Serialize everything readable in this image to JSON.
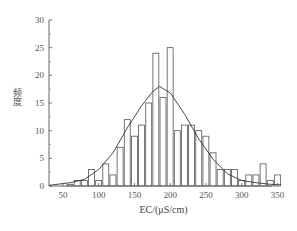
{
  "chart_data": {
    "type": "bar",
    "subtype": "histogram_with_normal_fit",
    "title": "",
    "xlabel": "EC/(μS/cm)",
    "ylabel": "频度",
    "xlim": [
      30,
      355
    ],
    "ylim": [
      0,
      30
    ],
    "xticks": [
      50,
      100,
      150,
      200,
      250,
      300,
      350
    ],
    "yticks": [
      0,
      5,
      10,
      15,
      20,
      25,
      30
    ],
    "grid": false,
    "legend": null,
    "bin_width": 10,
    "bins": [
      {
        "x": 60,
        "count": 0.3
      },
      {
        "x": 70,
        "count": 1
      },
      {
        "x": 80,
        "count": 1
      },
      {
        "x": 90,
        "count": 3
      },
      {
        "x": 100,
        "count": 1
      },
      {
        "x": 110,
        "count": 4
      },
      {
        "x": 120,
        "count": 2
      },
      {
        "x": 130,
        "count": 7
      },
      {
        "x": 140,
        "count": 12
      },
      {
        "x": 150,
        "count": 9
      },
      {
        "x": 160,
        "count": 11
      },
      {
        "x": 170,
        "count": 15
      },
      {
        "x": 180,
        "count": 24
      },
      {
        "x": 190,
        "count": 16
      },
      {
        "x": 200,
        "count": 25
      },
      {
        "x": 210,
        "count": 10
      },
      {
        "x": 220,
        "count": 11
      },
      {
        "x": 230,
        "count": 11
      },
      {
        "x": 240,
        "count": 10
      },
      {
        "x": 250,
        "count": 9
      },
      {
        "x": 260,
        "count": 6
      },
      {
        "x": 270,
        "count": 3
      },
      {
        "x": 280,
        "count": 3
      },
      {
        "x": 290,
        "count": 3
      },
      {
        "x": 300,
        "count": 1
      },
      {
        "x": 310,
        "count": 2
      },
      {
        "x": 320,
        "count": 2
      },
      {
        "x": 330,
        "count": 4
      },
      {
        "x": 340,
        "count": 1
      },
      {
        "x": 350,
        "count": 2
      }
    ],
    "fit_curve": {
      "type": "normal",
      "points": [
        [
          30,
          0.1
        ],
        [
          60,
          0.6
        ],
        [
          80,
          1.2
        ],
        [
          100,
          3
        ],
        [
          120,
          6
        ],
        [
          140,
          10.5
        ],
        [
          160,
          14.5
        ],
        [
          175,
          17
        ],
        [
          185,
          18
        ],
        [
          200,
          16.8
        ],
        [
          220,
          13
        ],
        [
          240,
          8.5
        ],
        [
          260,
          4.8
        ],
        [
          280,
          2.2
        ],
        [
          300,
          1.0
        ],
        [
          320,
          0.6
        ],
        [
          340,
          0.3
        ],
        [
          355,
          0.2
        ]
      ]
    }
  },
  "axes": {
    "x_title": "EC/(μS/cm)",
    "y_title": "频度"
  }
}
